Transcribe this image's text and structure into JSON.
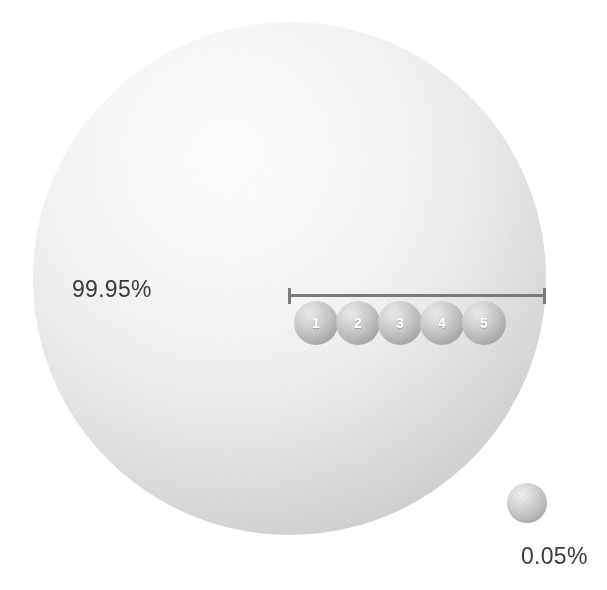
{
  "chart_data": {
    "type": "pie",
    "title": "",
    "subtitle": "",
    "xlabel": "",
    "ylabel": "",
    "categories": [
      "99.95%",
      "0.05%"
    ],
    "values": [
      99.95,
      0.05
    ],
    "units": "percent",
    "legend_position": "none",
    "grid": false,
    "annotations": [
      {
        "name": "scale-bar",
        "kind": "measurement-bar",
        "style": "i-beam-with-end-caps",
        "items": [
          "1",
          "2",
          "3",
          "4",
          "5"
        ]
      }
    ],
    "series": [
      {
        "name": "proportion",
        "values": [
          99.95,
          0.05
        ]
      }
    ]
  },
  "figure": {
    "big_sphere": {
      "label": "99.95%",
      "fill_color": "#e8e8e8",
      "edge_color": "#c0c0c0"
    },
    "small_sphere": {
      "label": "0.05%",
      "fill_color": "#c6c6c6",
      "edge_color": "#9e9e9e"
    },
    "scale_bar": {
      "color": "#7b7b7b",
      "spheres": [
        {
          "number": "1"
        },
        {
          "number": "2"
        },
        {
          "number": "3"
        },
        {
          "number": "4"
        },
        {
          "number": "5"
        }
      ]
    },
    "colors": {
      "background": "#ffffff",
      "label_text": "#3a3a3a",
      "sphere_number_text": "#ffffff"
    }
  }
}
